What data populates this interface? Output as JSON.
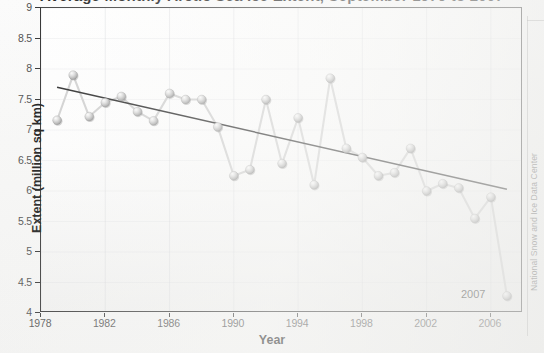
{
  "title": "Average Monthly Arctic Sea Ice Extent, September 1979 to 2007",
  "credit": "National Snow and Ice Data Center",
  "axes": {
    "ylabel": "Extent (million sq km)",
    "xlabel": "Year",
    "yticks": [
      "4",
      "4.5",
      "5",
      "5.5",
      "6",
      "6.5",
      "7",
      "7.5",
      "8",
      "8.5",
      "9"
    ],
    "xticks": [
      "1978",
      "1982",
      "1986",
      "1990",
      "1994",
      "1998",
      "2002",
      "2006"
    ]
  },
  "annotation": {
    "label": "2007"
  },
  "colors": {
    "marker": "#bdbdbd",
    "marker_highlight": "#f2f2f2",
    "marker_shadow": "#8a8a8a",
    "line": "#cfcfcf",
    "trend": "#222222",
    "axis": "#2b2b2b",
    "grid": "#c3c6cc",
    "text": "#1a1a1a"
  },
  "chart_data": {
    "type": "line",
    "title": "Average Monthly Arctic Sea Ice Extent, September 1979 to 2007",
    "xlabel": "Year",
    "ylabel": "Extent (million sq km)",
    "xlim": [
      1978,
      2008
    ],
    "ylim": [
      4,
      9
    ],
    "grid": true,
    "legend": null,
    "x": [
      1979,
      1980,
      1981,
      1982,
      1983,
      1984,
      1985,
      1986,
      1987,
      1988,
      1989,
      1990,
      1991,
      1992,
      1993,
      1994,
      1995,
      1996,
      1997,
      1998,
      1999,
      2000,
      2001,
      2002,
      2003,
      2004,
      2005,
      2006,
      2007
    ],
    "values": [
      7.16,
      7.9,
      7.22,
      7.45,
      7.55,
      7.3,
      7.15,
      7.6,
      7.5,
      7.5,
      7.05,
      6.25,
      6.35,
      7.5,
      6.45,
      7.2,
      6.1,
      7.85,
      6.7,
      6.55,
      6.25,
      6.3,
      6.7,
      6.0,
      6.12,
      6.05,
      5.55,
      5.9,
      4.28
    ],
    "series": [
      {
        "name": "September sea ice extent",
        "values": [
          7.16,
          7.9,
          7.22,
          7.45,
          7.55,
          7.3,
          7.15,
          7.6,
          7.5,
          7.5,
          7.05,
          6.25,
          6.35,
          7.5,
          6.45,
          7.2,
          6.1,
          7.85,
          6.7,
          6.55,
          6.25,
          6.3,
          6.7,
          6.0,
          6.12,
          6.05,
          5.55,
          5.9,
          4.28
        ]
      },
      {
        "name": "Linear trend",
        "type": "trendline",
        "x": [
          1979,
          2007
        ],
        "values": [
          7.7,
          6.03
        ]
      }
    ],
    "annotations": [
      {
        "text": "2007",
        "x": 2007,
        "y": 4.28
      }
    ]
  }
}
